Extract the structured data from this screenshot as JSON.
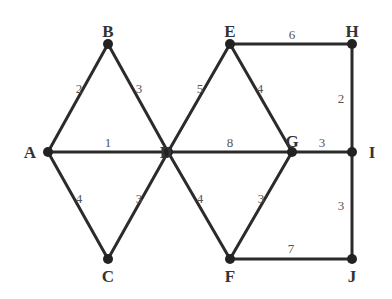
{
  "graph": {
    "nodes": [
      {
        "id": "A",
        "x": 48,
        "y": 152,
        "lx": 30,
        "ly": 158
      },
      {
        "id": "B",
        "x": 108,
        "y": 44,
        "lx": 108,
        "ly": 37
      },
      {
        "id": "C",
        "x": 108,
        "y": 259,
        "lx": 108,
        "ly": 282
      },
      {
        "id": "D",
        "x": 168,
        "y": 152,
        "lx": 166,
        "ly": 158
      },
      {
        "id": "E",
        "x": 230,
        "y": 44,
        "lx": 230,
        "ly": 37
      },
      {
        "id": "F",
        "x": 230,
        "y": 259,
        "lx": 230,
        "ly": 282
      },
      {
        "id": "G",
        "x": 292,
        "y": 152,
        "lx": 292,
        "ly": 147
      },
      {
        "id": "H",
        "x": 352,
        "y": 44,
        "lx": 352,
        "ly": 37
      },
      {
        "id": "I",
        "x": 352,
        "y": 152,
        "lx": 372,
        "ly": 158
      },
      {
        "id": "J",
        "x": 352,
        "y": 259,
        "lx": 352,
        "ly": 282
      }
    ],
    "edges": [
      {
        "from": "A",
        "to": "B",
        "w": "2",
        "lx": 79,
        "ly": 93
      },
      {
        "from": "B",
        "to": "D",
        "w": "3",
        "lx": 139,
        "ly": 93
      },
      {
        "from": "A",
        "to": "D",
        "w": "1",
        "lx": 108,
        "ly": 147
      },
      {
        "from": "A",
        "to": "C",
        "w": "4",
        "lx": 79,
        "ly": 203
      },
      {
        "from": "C",
        "to": "D",
        "w": "3",
        "lx": 139,
        "ly": 203
      },
      {
        "from": "D",
        "to": "E",
        "w": "5",
        "lx": 200,
        "ly": 93
      },
      {
        "from": "E",
        "to": "G",
        "w": "4",
        "lx": 260,
        "ly": 93
      },
      {
        "from": "D",
        "to": "G",
        "w": "8",
        "lx": 230,
        "ly": 147
      },
      {
        "from": "D",
        "to": "F",
        "w": "4",
        "lx": 200,
        "ly": 203
      },
      {
        "from": "F",
        "to": "G",
        "w": "3",
        "lx": 261,
        "ly": 203
      },
      {
        "from": "E",
        "to": "H",
        "w": "6",
        "lx": 292,
        "ly": 39
      },
      {
        "from": "H",
        "to": "I",
        "w": "2",
        "lx": 341,
        "ly": 103
      },
      {
        "from": "G",
        "to": "I",
        "w": "3",
        "lx": 322,
        "ly": 147
      },
      {
        "from": "I",
        "to": "J",
        "w": "3",
        "lx": 341,
        "ly": 210
      },
      {
        "from": "F",
        "to": "J",
        "w": "7",
        "lx": 291,
        "ly": 253
      }
    ]
  }
}
